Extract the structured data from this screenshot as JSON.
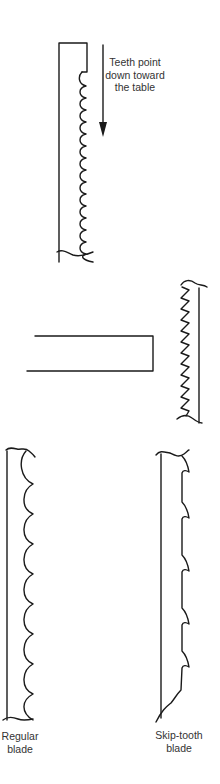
{
  "figure": {
    "annotations": {
      "direction_note": [
        "Teeth point",
        "down toward",
        "the table"
      ],
      "regular_blade": [
        "Regular",
        "blade"
      ],
      "skip_tooth_blade": [
        "Skip-tooth",
        "blade"
      ]
    },
    "elements": [
      {
        "id": "blade-side-view",
        "description": "Blade shown from the side with rounded teeth along its right edge"
      },
      {
        "id": "direction-arrow",
        "description": "Downward arrow indicating tooth direction"
      },
      {
        "id": "table-edge",
        "description": "Open rectangle representing the saw table"
      },
      {
        "id": "zigzag-blade",
        "description": "Blade with zigzag teeth facing the table"
      },
      {
        "id": "regular-blade",
        "description": "Regular blade profile with evenly spaced curved teeth"
      },
      {
        "id": "skip-tooth-blade",
        "description": "Skip-tooth blade profile with widely spaced teeth"
      }
    ],
    "colors": {
      "line": "#1a1a1a",
      "text": "#333333",
      "background": "#ffffff"
    }
  }
}
